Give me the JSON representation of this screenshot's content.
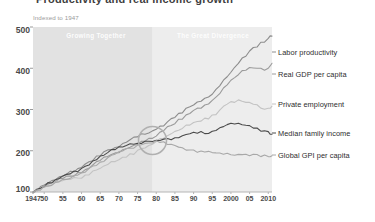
{
  "title": "Productivity and real income growth",
  "subtitle": "Indexed to 1947",
  "axes": {
    "y_ticks": [
      "500",
      "400",
      "300",
      "200",
      "100"
    ],
    "x_ticks": [
      "1947",
      "50",
      "55",
      "60",
      "65",
      "70",
      "75",
      "80",
      "85",
      "90",
      "95",
      "2000",
      "05",
      "2010"
    ]
  },
  "bands": [
    {
      "label": "Growing Together",
      "x_start": 1947,
      "x_end": 1979
    },
    {
      "label": "The Great Divergence",
      "x_start": 1979,
      "x_end": 2011
    }
  ],
  "legend": [
    {
      "label": "Labor productivity",
      "color": "#8d8d8d"
    },
    {
      "label": "Real GDP per capita",
      "color": "#9b9b9b"
    },
    {
      "label": "Private employment",
      "color": "#c3c3c3"
    },
    {
      "label": "Median family income",
      "color": "#4a4a4a"
    },
    {
      "label": "Global GPI per capita",
      "color": "#a8a8a8"
    }
  ],
  "colors": {
    "band_early": "#e2e2e2",
    "band_late": "#ededed",
    "plot_bg": "#f2f2f2",
    "annotation_circle": "#b0b0b0",
    "axis_text": "#4a4a4a",
    "subtitle_text": "#9a9a9a"
  },
  "annotation": {
    "shape": "circle",
    "x_year": 1979,
    "y_value": 225,
    "note": "divergence point"
  },
  "chart_data": {
    "type": "line",
    "title": "Productivity and real income growth",
    "subtitle": "Indexed to 1947",
    "xlabel": "",
    "ylabel": "Indexed to 1947",
    "xlim": [
      1947,
      2011
    ],
    "ylim": [
      100,
      500
    ],
    "grid": false,
    "legend_position": "right-inline",
    "x": [
      1947,
      1950,
      1955,
      1960,
      1965,
      1970,
      1975,
      1980,
      1985,
      1990,
      1995,
      2000,
      2005,
      2010,
      2011
    ],
    "series": [
      {
        "name": "Labor productivity",
        "color": "#8d8d8d",
        "values": [
          100,
          118,
          140,
          160,
          190,
          212,
          236,
          252,
          282,
          312,
          338,
          392,
          440,
          470,
          478
        ]
      },
      {
        "name": "Real GDP per capita",
        "color": "#9b9b9b",
        "values": [
          100,
          114,
          134,
          148,
          178,
          198,
          216,
          238,
          268,
          296,
          320,
          370,
          400,
          398,
          412
        ]
      },
      {
        "name": "Private employment",
        "color": "#c3c3c3",
        "values": [
          100,
          112,
          128,
          136,
          158,
          180,
          198,
          222,
          246,
          268,
          284,
          318,
          316,
          300,
          308
        ]
      },
      {
        "name": "Median family income",
        "color": "#4a4a4a",
        "values": [
          100,
          116,
          138,
          156,
          186,
          208,
          218,
          224,
          230,
          244,
          246,
          266,
          258,
          244,
          240
        ]
      },
      {
        "name": "Global GPI per capita",
        "color": "#a8a8a8",
        "values": [
          100,
          112,
          130,
          146,
          172,
          196,
          212,
          222,
          212,
          200,
          196,
          192,
          190,
          188,
          188
        ]
      }
    ]
  }
}
